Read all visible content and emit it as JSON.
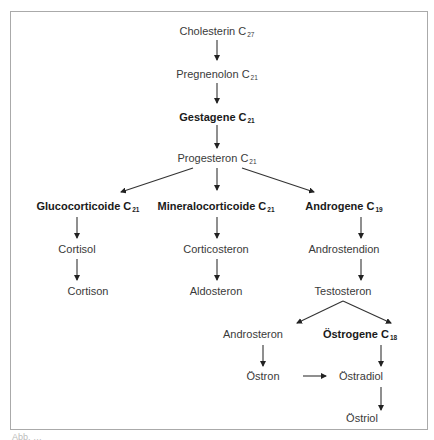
{
  "diagram": {
    "nodes": [
      {
        "id": "cholesterin",
        "label": "Cholesterin",
        "sub": "27",
        "bold": false
      },
      {
        "id": "pregnenolon",
        "label": "Pregnenolon",
        "sub": "21",
        "bold": false
      },
      {
        "id": "gestagene",
        "label": "Gestagene",
        "sub": "21",
        "bold": true
      },
      {
        "id": "progesteron",
        "label": "Progesteron",
        "sub": "21",
        "bold": false
      },
      {
        "id": "glucocorticoide",
        "label": "Glucocorticoide",
        "sub": "21",
        "bold": true
      },
      {
        "id": "mineralocorticoide",
        "label": "Mineralocorticoide",
        "sub": "21",
        "bold": true
      },
      {
        "id": "androgene",
        "label": "Androgene",
        "sub": "19",
        "bold": true
      },
      {
        "id": "cortisol",
        "label": "Cortisol",
        "sub": "",
        "bold": false
      },
      {
        "id": "corticosteron",
        "label": "Corticosteron",
        "sub": "",
        "bold": false
      },
      {
        "id": "androstendion",
        "label": "Androstendion",
        "sub": "",
        "bold": false
      },
      {
        "id": "cortison",
        "label": "Cortison",
        "sub": "",
        "bold": false
      },
      {
        "id": "aldosteron",
        "label": "Aldosteron",
        "sub": "",
        "bold": false
      },
      {
        "id": "testosteron",
        "label": "Testosteron",
        "sub": "",
        "bold": false
      },
      {
        "id": "androsteron",
        "label": "Androsteron",
        "sub": "",
        "bold": false
      },
      {
        "id": "oestrogene",
        "label": "Östrogene",
        "sub": "18",
        "bold": true
      },
      {
        "id": "oestron",
        "label": "Östron",
        "sub": "",
        "bold": false
      },
      {
        "id": "oestradiol",
        "label": "Östradiol",
        "sub": "",
        "bold": false
      },
      {
        "id": "oestriol",
        "label": "Östriol",
        "sub": "",
        "bold": false
      }
    ],
    "edges": [
      [
        "cholesterin",
        "pregnenolon"
      ],
      [
        "pregnenolon",
        "gestagene"
      ],
      [
        "gestagene",
        "progesteron"
      ],
      [
        "progesteron",
        "glucocorticoide"
      ],
      [
        "progesteron",
        "mineralocorticoide"
      ],
      [
        "progesteron",
        "androgene"
      ],
      [
        "glucocorticoide",
        "cortisol"
      ],
      [
        "cortisol",
        "cortison"
      ],
      [
        "mineralocorticoide",
        "corticosteron"
      ],
      [
        "corticosteron",
        "aldosteron"
      ],
      [
        "androgene",
        "androstendion"
      ],
      [
        "androstendion",
        "testosteron"
      ],
      [
        "testosteron",
        "androsteron"
      ],
      [
        "testosteron",
        "oestrogene"
      ],
      [
        "androsteron",
        "oestron"
      ],
      [
        "oestron",
        "oestradiol"
      ],
      [
        "oestrogene",
        "oestradiol"
      ],
      [
        "oestradiol",
        "oestriol"
      ]
    ],
    "caption": "Abb. …"
  }
}
